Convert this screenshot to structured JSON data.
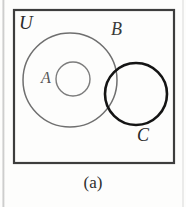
{
  "figure": {
    "caption": "(a)",
    "background_color": "#fdfdfc",
    "diagram_type": "venn-diagram",
    "description_labels": {
      "universe": "U",
      "set_b": "B",
      "set_a": "A",
      "set_c": "C"
    },
    "universe_box": {
      "label": "U",
      "x": 14,
      "y": 10,
      "width": 160,
      "height": 153,
      "stroke_color": "#3d3d3d",
      "stroke_width": 2.2,
      "fill": "none"
    },
    "circles": [
      {
        "name": "B",
        "label": "B",
        "cx": 70,
        "cy": 80,
        "r": 47,
        "stroke_color": "#6f6f6f",
        "stroke_width": 1.5,
        "fill": "none",
        "label_x": 111,
        "label_y": 20
      },
      {
        "name": "A",
        "label": "A",
        "cx": 73,
        "cy": 79,
        "r": 17,
        "stroke_color": "#7c7c7c",
        "stroke_width": 1.4,
        "fill": "none",
        "label_x": 41,
        "label_y": 70
      },
      {
        "name": "C",
        "label": "C",
        "cx": 136,
        "cy": 94,
        "r": 31,
        "stroke_color": "#141414",
        "stroke_width": 2.6,
        "fill": "none",
        "label_x": 137,
        "label_y": 126
      }
    ],
    "relations": {
      "a_subset_of_b": true,
      "c_overlaps_b": true,
      "a_disjoint_from_c": true,
      "all_within_universe": true
    },
    "artifacts": {
      "left_scan_line": "vertical faint gray scan line at left margin",
      "right_scan_line": "vertical faint gray scan line at right margin"
    }
  }
}
